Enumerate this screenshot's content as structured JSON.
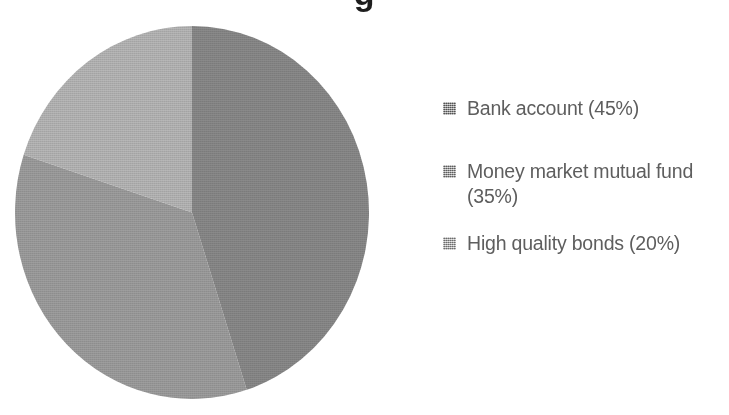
{
  "page": {
    "background": "#ffffff",
    "width": 729,
    "height": 415
  },
  "title": {
    "cropped_remnant": "g",
    "note_visible_text": ""
  },
  "chart_data": {
    "type": "pie",
    "title": "",
    "categories": [
      "Bank account",
      "Money market mutual fund",
      "High quality bonds"
    ],
    "values": [
      45,
      35,
      20
    ],
    "value_suffix": "%",
    "colors": [
      "#8a8a8a",
      "#9e9e9e",
      "#b7b7b7"
    ],
    "start_angle_deg": 0,
    "direction": "clockwise",
    "legend_position": "right",
    "grid": false,
    "labels_on_slices": false,
    "slices": [
      {
        "label": "Bank account",
        "value": 45,
        "color": "#8a8a8a",
        "start_deg": 0,
        "end_deg": 162
      },
      {
        "label": "Money market mutual fund",
        "value": 35,
        "color": "#9e9e9e",
        "start_deg": 162,
        "end_deg": 288
      },
      {
        "label": "High quality bonds",
        "value": 20,
        "color": "#b7b7b7",
        "start_deg": 288,
        "end_deg": 360
      }
    ]
  },
  "legend": {
    "items": [
      {
        "label": "Bank account (45%)",
        "color": "#8a8a8a"
      },
      {
        "label": "Money market mutual fund (35%)",
        "color": "#9e9e9e"
      },
      {
        "label": "High quality bonds (20%)",
        "color": "#b7b7b7"
      }
    ]
  },
  "text_color": "#5e5e5e"
}
